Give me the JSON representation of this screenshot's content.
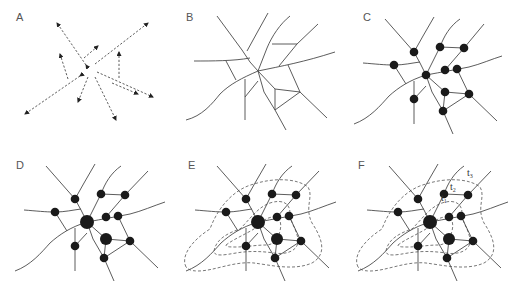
{
  "panels": [
    {
      "id": "A",
      "label": "A",
      "description": "Random flows (dashed arrows)"
    },
    {
      "id": "B",
      "label": "B",
      "description": "Street network"
    },
    {
      "id": "C",
      "label": "C",
      "description": "Network with intersection nodes"
    },
    {
      "id": "D",
      "label": "D",
      "description": "Nodes weighted by centrality (larger hubs)"
    },
    {
      "id": "E",
      "label": "E",
      "description": "Network with dashed isochrone contours"
    },
    {
      "id": "F",
      "label": "F",
      "description": "Network with labeled isochrone contours"
    }
  ],
  "contour_labels": [
    {
      "main": "t",
      "sub": "1"
    },
    {
      "main": "t",
      "sub": "2"
    },
    {
      "main": "t",
      "sub": "3"
    }
  ],
  "colors": {
    "line": "#4a4a4a",
    "node": "#1a1a1a",
    "label": "#555555",
    "background": "#ffffff"
  }
}
